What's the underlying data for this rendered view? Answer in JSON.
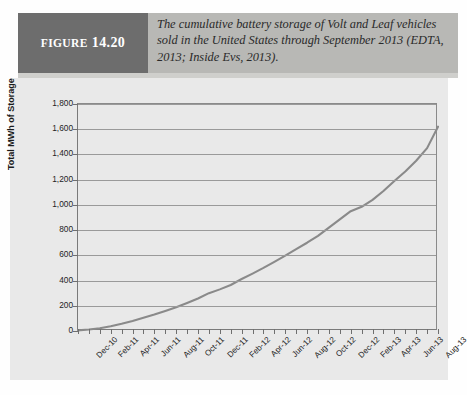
{
  "figure": {
    "label_word": "FIGURE",
    "number": "14.20",
    "caption": "The cumulative battery storage of Volt and Leaf vehicles sold in the United States through September 2013 (EDTA, 2013; Inside Evs, 2013)."
  },
  "colors": {
    "label_box": "#6d6d6d",
    "caption_band": "#b8b8b5",
    "panel": "#e9e9e9",
    "line": "#8a8a8a",
    "grid": "#9a9a9a",
    "axis": "#7a7a7a",
    "text": "#1d1d1d"
  },
  "chart_data": {
    "type": "line",
    "title": "",
    "xlabel": "",
    "ylabel": "Total MWh of Storage",
    "ylim": [
      0,
      1800
    ],
    "ytick_step": 200,
    "ytick_labels": [
      "0",
      "200",
      "400",
      "600",
      "800",
      "1,000",
      "1,200",
      "1,400",
      "1,600",
      "1,800"
    ],
    "ytick_values": [
      0,
      200,
      400,
      600,
      800,
      1000,
      1200,
      1400,
      1600,
      1800
    ],
    "grid": true,
    "legend": "none",
    "x_tick_labels": [
      "Dec-10",
      "Feb-11",
      "Apr-11",
      "Jun-11",
      "Aug-11",
      "Oct-11",
      "Dec-11",
      "Feb-12",
      "Apr-12",
      "Jun-12",
      "Aug-12",
      "Oct-12",
      "Dec-12",
      "Feb-13",
      "Apr-13",
      "Jun-13",
      "Aug-13"
    ],
    "x": [
      "Dec-10",
      "Jan-11",
      "Feb-11",
      "Mar-11",
      "Apr-11",
      "May-11",
      "Jun-11",
      "Jul-11",
      "Aug-11",
      "Sep-11",
      "Oct-11",
      "Nov-11",
      "Dec-11",
      "Jan-12",
      "Feb-12",
      "Mar-12",
      "Apr-12",
      "May-12",
      "Jun-12",
      "Jul-12",
      "Aug-12",
      "Sep-12",
      "Oct-12",
      "Nov-12",
      "Dec-12",
      "Jan-13",
      "Feb-13",
      "Mar-13",
      "Apr-13",
      "May-13",
      "Jun-13",
      "Jul-13",
      "Aug-13",
      "Sep-13"
    ],
    "series": [
      {
        "name": "Cumulative battery storage (Volt and Leaf)",
        "values": [
          5,
          12,
          22,
          38,
          58,
          80,
          105,
          130,
          158,
          188,
          222,
          258,
          300,
          330,
          365,
          412,
          455,
          500,
          548,
          598,
          650,
          700,
          755,
          820,
          885,
          950,
          985,
          1040,
          1110,
          1190,
          1265,
          1350,
          1450,
          1620
        ]
      }
    ]
  }
}
